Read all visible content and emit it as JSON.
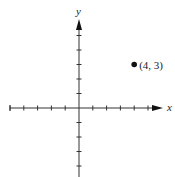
{
  "chart_data": {
    "type": "scatter",
    "title": "",
    "xlabel": "x",
    "ylabel": "y",
    "xlim": [
      -5,
      6
    ],
    "ylim": [
      -5,
      6
    ],
    "x_ticks": [
      -5,
      -4,
      -3,
      -2,
      -1,
      1,
      2,
      3,
      4,
      5
    ],
    "y_ticks": [
      -5,
      -4,
      -3,
      -2,
      -1,
      1,
      2,
      3,
      4,
      5
    ],
    "tick_labels_shown": false,
    "grid": false,
    "legend": null,
    "series": [
      {
        "name": "point",
        "points": [
          {
            "x": 4,
            "y": 3,
            "label": "(4, 3)"
          }
        ]
      }
    ]
  },
  "colors": {
    "axis": "#333333",
    "point": "#111111",
    "background": "#ffffff"
  },
  "labels": {
    "x_axis": "x",
    "y_axis": "y",
    "point": "(4, 3)"
  }
}
